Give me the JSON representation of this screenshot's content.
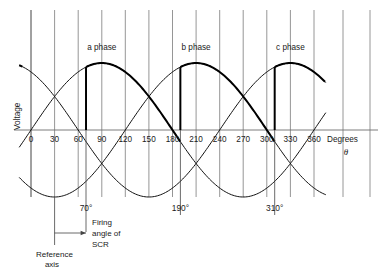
{
  "figure": {
    "axis": {
      "y_label": "Voltage",
      "x_label": "Degrees",
      "x_symbol": "θ",
      "x_ticks": [
        "0",
        "30",
        "60",
        "90",
        "120",
        "150",
        "180",
        "210",
        "240",
        "270",
        "300",
        "330",
        "360"
      ],
      "x_tick_values": [
        0,
        30,
        60,
        90,
        120,
        150,
        180,
        210,
        240,
        270,
        300,
        330,
        360
      ],
      "x_min": 0,
      "x_max": 360,
      "grid": true
    },
    "phase_labels": [
      {
        "text": "a phase",
        "at_degrees": 90
      },
      {
        "text": "b phase",
        "at_degrees": 210
      },
      {
        "text": "c phase",
        "at_degrees": 330
      }
    ],
    "firing_angles": [
      {
        "label": "70°",
        "degrees": 70
      },
      {
        "label": "190°",
        "degrees": 190
      },
      {
        "label": "310°",
        "degrees": 310
      }
    ],
    "annotations": {
      "firing_note_line1": "Firing",
      "firing_note_line2": "angle of",
      "firing_note_line3": "SCR",
      "reference_line1": "Reference",
      "reference_line2": "axis",
      "reference_degrees": 30
    },
    "colors": {
      "grid": "#8a8a8a",
      "axis": "#6e6e6e",
      "wave": "#111111",
      "wave_bold": "#000000",
      "text": "#1a1a1a",
      "background": "#ffffff"
    }
  },
  "chart_data": {
    "type": "line",
    "xlabel": "Degrees θ",
    "ylabel": "Voltage",
    "xlim": [
      0,
      360
    ],
    "ylim": [
      -1,
      1
    ],
    "grid": true,
    "legend": "inline labels above each positive peak",
    "x_ticks": [
      0,
      30,
      60,
      90,
      120,
      150,
      180,
      210,
      240,
      270,
      300,
      330,
      360
    ],
    "series": [
      {
        "name": "a phase",
        "phase_offset_deg": 0,
        "amplitude": 1,
        "peak_deg": 90,
        "conduction_start_deg": 70,
        "label_deg": 90
      },
      {
        "name": "b phase",
        "phase_offset_deg": 120,
        "amplitude": 1,
        "peak_deg": 210,
        "conduction_start_deg": 190,
        "label_deg": 210
      },
      {
        "name": "c phase",
        "phase_offset_deg": 240,
        "amplitude": 1,
        "peak_deg": 330,
        "conduction_start_deg": 310,
        "label_deg": 330
      }
    ],
    "annotations": [
      {
        "text": "70°",
        "x": 70
      },
      {
        "text": "190°",
        "x": 190
      },
      {
        "text": "310°",
        "x": 310
      },
      {
        "text": "Firing angle of SCR",
        "x": 70
      },
      {
        "text": "Reference axis",
        "x": 30
      }
    ]
  }
}
